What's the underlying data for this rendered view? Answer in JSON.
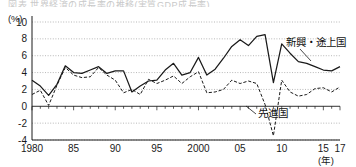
{
  "page": {
    "clipped_header_text": "図表  世界経済の成長率の推移(実質GDP成長率)"
  },
  "axes": {
    "y_unit": "(%)",
    "x_unit": "(年)",
    "y_ticks": [
      10,
      8,
      6,
      4,
      2,
      0,
      -2,
      -4
    ],
    "y_tick_labels": [
      "10",
      "8",
      "6",
      "4",
      "2",
      "0",
      "-2",
      "-4"
    ],
    "x_tick_values": [
      1980,
      1985,
      1990,
      1995,
      2000,
      2005,
      2010,
      2015,
      2017
    ],
    "x_tick_labels": [
      "1980",
      "85",
      "90",
      "95",
      "2000",
      "05",
      "10",
      "15",
      "17"
    ]
  },
  "annotations": [
    {
      "name": "emerging-label",
      "text": "新興・途上国",
      "x": 286,
      "y": 46
    },
    {
      "name": "advanced-label",
      "text": "先進国",
      "x": 258,
      "y": 117
    }
  ],
  "colors": {
    "line": "#1a1a1a",
    "grid": "#999999",
    "axis": "#1a1a1a",
    "background": "#ffffff"
  },
  "chart_data": {
    "type": "line",
    "title": "",
    "subtitle": "",
    "xlabel": "(年)",
    "ylabel": "(%)",
    "xlim": [
      1980,
      2017
    ],
    "ylim": [
      -4,
      10
    ],
    "grid": true,
    "grid_axis": "y",
    "legend": "inline-annotations",
    "x": [
      1980,
      1981,
      1982,
      1983,
      1984,
      1985,
      1986,
      1987,
      1988,
      1989,
      1990,
      1991,
      1992,
      1993,
      1994,
      1995,
      1996,
      1997,
      1998,
      1999,
      2000,
      2001,
      2002,
      2003,
      2004,
      2005,
      2006,
      2007,
      2008,
      2009,
      2010,
      2011,
      2012,
      2013,
      2014,
      2015,
      2016,
      2017
    ],
    "series": [
      {
        "name": "新興・途上国",
        "style": "solid",
        "values": [
          3.1,
          2.4,
          1.3,
          2.6,
          4.8,
          4.0,
          3.9,
          4.3,
          4.7,
          3.9,
          4.2,
          4.2,
          1.7,
          2.4,
          3.0,
          3.1,
          4.3,
          5.1,
          3.7,
          4.0,
          5.8,
          3.7,
          4.4,
          5.7,
          7.1,
          7.9,
          7.2,
          8.3,
          8.5,
          2.8,
          7.4,
          6.3,
          5.3,
          5.1,
          4.7,
          4.3,
          4.2,
          4.7
        ]
      },
      {
        "name": "先進国",
        "style": "dashed",
        "values": [
          1.4,
          1.9,
          0.1,
          2.5,
          4.6,
          3.7,
          3.4,
          3.5,
          4.6,
          3.7,
          3.1,
          1.6,
          2.0,
          1.4,
          3.2,
          2.7,
          3.1,
          3.6,
          2.7,
          3.5,
          4.1,
          1.6,
          1.7,
          2.0,
          3.1,
          2.7,
          3.0,
          2.7,
          0.2,
          -3.5,
          3.1,
          1.7,
          1.2,
          1.4,
          2.1,
          2.2,
          1.7,
          2.3
        ]
      }
    ]
  }
}
